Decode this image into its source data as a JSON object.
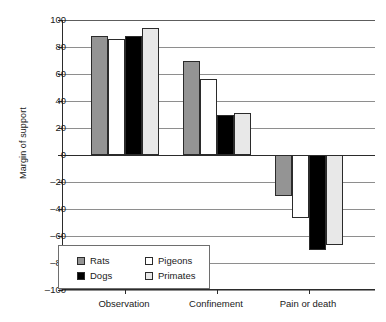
{
  "chart_data": {
    "type": "bar",
    "title": "",
    "xlabel": "",
    "ylabel": "Margin of support",
    "ylim": [
      -100,
      100
    ],
    "yticks": [
      100,
      80,
      60,
      40,
      20,
      0,
      -20,
      -40,
      -60,
      -80,
      -100
    ],
    "grid": true,
    "legend_position": "bottom-left-inside",
    "categories": [
      "Observation",
      "Confinement",
      "Pain or death"
    ],
    "series": [
      {
        "name": "Rats",
        "color": "#949494",
        "values": [
          88,
          70,
          -30
        ]
      },
      {
        "name": "Dogs",
        "color": "#000000",
        "values": [
          88,
          30,
          -70
        ]
      },
      {
        "name": "Pigeons",
        "color": "#ffffff",
        "values": [
          86,
          56,
          -47
        ]
      },
      {
        "name": "Primates",
        "color": "#e8e8e8",
        "values": [
          94,
          31,
          -67
        ]
      }
    ],
    "series_draw_order": [
      "Rats",
      "Pigeons",
      "Dogs",
      "Primates"
    ]
  },
  "axes": {
    "y_title": "Margin of support",
    "y_tick_labels": [
      "100",
      "80",
      "60",
      "40",
      "20",
      "0",
      "–20",
      "–40",
      "–60",
      "–80",
      "–100"
    ],
    "x_tick_labels": [
      "Observation",
      "Confinement",
      "Pain or death"
    ]
  },
  "legend": {
    "entries": [
      {
        "label": "Rats",
        "swatch": "legend-swatch-rats"
      },
      {
        "label": "Pigeons",
        "swatch": "legend-swatch-pigeons"
      },
      {
        "label": "Dogs",
        "swatch": "legend-swatch-dogs"
      },
      {
        "label": "Primates",
        "swatch": "legend-swatch-primates"
      }
    ]
  }
}
